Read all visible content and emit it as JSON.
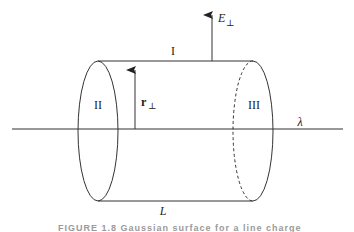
{
  "diagram": {
    "type": "gaussian-cylinder",
    "labels": {
      "top_surface": "I",
      "left_cap": "II",
      "right_cap": "III",
      "line_charge": "λ",
      "length": "L",
      "radius_vector": "r",
      "radius_subscript": "⊥",
      "field_vector": "E",
      "field_subscript": "⊥"
    },
    "caption": "FIGURE 1.8 Gaussian surface for a line charge",
    "colors": {
      "stroke": "#333333",
      "caption": "#9a9a9a",
      "background": "#ffffff"
    }
  }
}
